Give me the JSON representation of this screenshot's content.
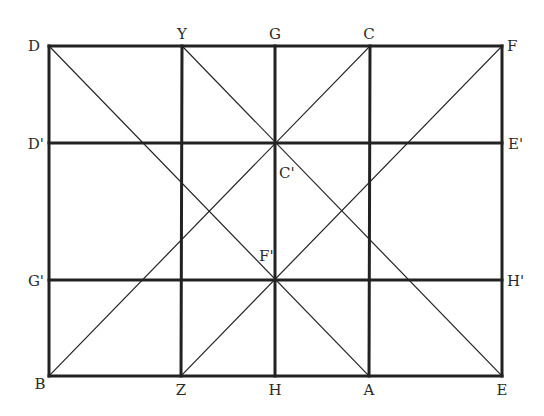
{
  "diagram": {
    "type": "geometric grid construction",
    "frame": {
      "x1": 49,
      "y1": 46,
      "x2": 502,
      "y2": 376
    },
    "colors": {
      "line": "#222222",
      "label": "#2a2a2a",
      "background": "#ffffff"
    },
    "points": [
      {
        "id": "D",
        "label": "D",
        "x": 49,
        "y": 46,
        "lx": 40,
        "ly": 51,
        "anchor": "end"
      },
      {
        "id": "Y",
        "label": "Y",
        "x": 182,
        "y": 46,
        "lx": 182,
        "ly": 39,
        "anchor": "middle"
      },
      {
        "id": "G",
        "label": "G",
        "x": 275,
        "y": 46,
        "lx": 275,
        "ly": 39,
        "anchor": "middle"
      },
      {
        "id": "C",
        "label": "C",
        "x": 370,
        "y": 46,
        "lx": 369,
        "ly": 39,
        "anchor": "middle"
      },
      {
        "id": "F",
        "label": "F",
        "x": 502,
        "y": 46,
        "lx": 507,
        "ly": 51,
        "anchor": "start"
      },
      {
        "id": "Dp",
        "label": "D'",
        "x": 49,
        "y": 143,
        "lx": 44,
        "ly": 149,
        "anchor": "end"
      },
      {
        "id": "Ep",
        "label": "E'",
        "x": 502,
        "y": 143,
        "lx": 508,
        "ly": 149,
        "anchor": "start"
      },
      {
        "id": "Cp",
        "label": "C'",
        "x": 275,
        "y": 143,
        "lx": 279,
        "ly": 178,
        "anchor": "start"
      },
      {
        "id": "Fp",
        "label": "F'",
        "x": 275,
        "y": 280,
        "lx": 259,
        "ly": 261,
        "anchor": "start"
      },
      {
        "id": "Gp",
        "label": "G'",
        "x": 49,
        "y": 280,
        "lx": 44,
        "ly": 286,
        "anchor": "end"
      },
      {
        "id": "Hp",
        "label": "H'",
        "x": 502,
        "y": 280,
        "lx": 507,
        "ly": 286,
        "anchor": "start"
      },
      {
        "id": "B",
        "label": "B",
        "x": 49,
        "y": 376,
        "lx": 40,
        "ly": 389,
        "anchor": "middle"
      },
      {
        "id": "Z",
        "label": "Z",
        "x": 181,
        "y": 376,
        "lx": 181,
        "ly": 395,
        "anchor": "middle"
      },
      {
        "id": "H",
        "label": "H",
        "x": 275,
        "y": 376,
        "lx": 275,
        "ly": 395,
        "anchor": "middle"
      },
      {
        "id": "A",
        "label": "A",
        "x": 369,
        "y": 376,
        "lx": 369,
        "ly": 395,
        "anchor": "middle"
      },
      {
        "id": "E",
        "label": "E",
        "x": 502,
        "y": 376,
        "lx": 502,
        "ly": 395,
        "anchor": "middle"
      }
    ],
    "thick_lines": [
      {
        "name": "top-edge-DF",
        "x1": 49,
        "y1": 46,
        "x2": 502,
        "y2": 46
      },
      {
        "name": "bottom-edge-BE",
        "x1": 49,
        "y1": 376,
        "x2": 502,
        "y2": 376
      },
      {
        "name": "left-edge-DB",
        "x1": 49,
        "y1": 46,
        "x2": 49,
        "y2": 376
      },
      {
        "name": "right-edge-FE",
        "x1": 502,
        "y1": 46,
        "x2": 502,
        "y2": 376
      },
      {
        "name": "horizontal-DpEp",
        "x1": 49,
        "y1": 143,
        "x2": 502,
        "y2": 143
      },
      {
        "name": "horizontal-GpHp",
        "x1": 49,
        "y1": 280,
        "x2": 502,
        "y2": 280
      },
      {
        "name": "vertical-YZ",
        "x1": 182,
        "y1": 46,
        "x2": 181,
        "y2": 376
      },
      {
        "name": "vertical-GH",
        "x1": 275,
        "y1": 46,
        "x2": 275,
        "y2": 376
      },
      {
        "name": "vertical-CA",
        "x1": 370,
        "y1": 46,
        "x2": 369,
        "y2": 376
      }
    ],
    "thin_lines": [
      {
        "name": "diagonal-DA",
        "x1": 49,
        "y1": 46,
        "x2": 369,
        "y2": 376
      },
      {
        "name": "diagonal-YE",
        "x1": 182,
        "y1": 46,
        "x2": 502,
        "y2": 376
      },
      {
        "name": "diagonal-CB",
        "x1": 370,
        "y1": 46,
        "x2": 49,
        "y2": 376
      },
      {
        "name": "diagonal-FZ",
        "x1": 502,
        "y1": 46,
        "x2": 181,
        "y2": 376
      }
    ]
  }
}
